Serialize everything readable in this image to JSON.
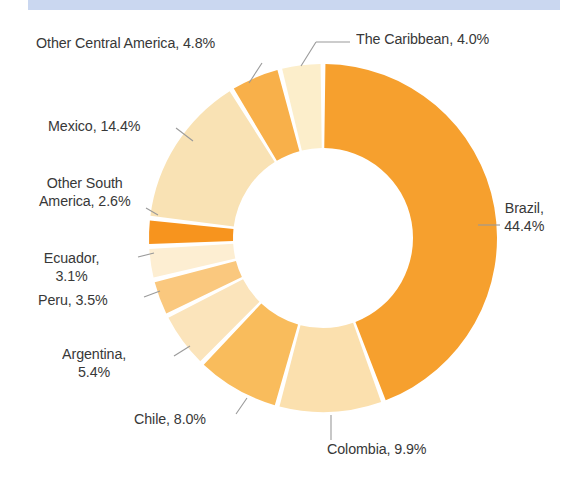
{
  "page": {
    "background_color": "#ffffff",
    "top_strip_color": "#c3d2ee"
  },
  "chart_data": {
    "type": "pie",
    "variant": "donut",
    "title": "",
    "subtitle": "",
    "xlabel": "",
    "ylabel": "",
    "legend_position": "none",
    "labels_position": "outside-with-leader-lines",
    "value_unit": "percent",
    "start_angle_deg": 0,
    "direction": "clockwise",
    "inner_radius_ratio": 0.52,
    "categories": [
      "Brazil",
      "Colombia",
      "Chile",
      "Argentina",
      "Peru",
      "Ecuador",
      "Other South America",
      "Mexico",
      "Other Central America",
      "The Caribbean"
    ],
    "values": [
      44.4,
      9.9,
      8.0,
      5.4,
      3.5,
      3.1,
      2.6,
      14.4,
      4.8,
      4.0
    ],
    "colors": [
      "#f6a02e",
      "#fbe0ae",
      "#f9bc5c",
      "#fbe4bb",
      "#fac87e",
      "#fdeed2",
      "#f7941e",
      "#f9e2b4",
      "#f8b04a",
      "#fceecb"
    ],
    "slices": [
      {
        "label": "Brazil",
        "value": 44.4,
        "text": "Brazil,\n44.4%",
        "color": "#f6a02e"
      },
      {
        "label": "Colombia",
        "value": 9.9,
        "text": "Colombia, 9.9%",
        "color": "#fbe0ae"
      },
      {
        "label": "Chile",
        "value": 8.0,
        "text": "Chile, 8.0%",
        "color": "#f9bc5c"
      },
      {
        "label": "Argentina",
        "value": 5.4,
        "text": "Argentina,\n5.4%",
        "color": "#fbe4bb"
      },
      {
        "label": "Peru",
        "value": 3.5,
        "text": "Peru, 3.5%",
        "color": "#fac87e"
      },
      {
        "label": "Ecuador",
        "value": 3.1,
        "text": "Ecuador,\n3.1%",
        "color": "#fdeed2"
      },
      {
        "label": "Other South America",
        "value": 2.6,
        "text": "Other South\nAmerica, 2.6%",
        "color": "#f7941e"
      },
      {
        "label": "Mexico",
        "value": 14.4,
        "text": "Mexico, 14.4%",
        "color": "#f9e2b4"
      },
      {
        "label": "Other Central America",
        "value": 4.8,
        "text": "Other Central America, 4.8%",
        "color": "#f8b04a"
      },
      {
        "label": "The Caribbean",
        "value": 4.0,
        "text": "The Caribbean, 4.0%",
        "color": "#fceecb"
      }
    ],
    "total": 100.1
  },
  "labels": {
    "brazil": "Brazil,\n44.4%",
    "colombia": "Colombia, 9.9%",
    "chile": "Chile, 8.0%",
    "argentina": "Argentina,\n5.4%",
    "peru": "Peru, 3.5%",
    "ecuador": "Ecuador,\n3.1%",
    "other_south_america": "Other South\nAmerica, 2.6%",
    "mexico": "Mexico, 14.4%",
    "other_central_america": "Other Central America, 4.8%",
    "the_caribbean": "The Caribbean, 4.0%"
  }
}
